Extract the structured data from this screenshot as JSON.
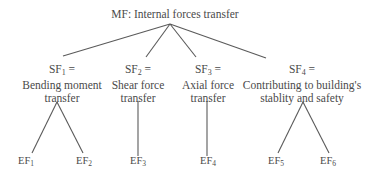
{
  "diagram": {
    "type": "hierarchy-tree",
    "root": {
      "id": "MF",
      "label": "MF: Internal forces transfer"
    },
    "sub_functions": [
      {
        "id": "SF",
        "index": "1",
        "prefix": "SF",
        "equals": " =",
        "lines": [
          "Bending moment",
          "transfer"
        ],
        "children": [
          "EF1",
          "EF2"
        ]
      },
      {
        "id": "SF",
        "index": "2",
        "prefix": "SF",
        "equals": " =",
        "lines": [
          "Shear force",
          "transfer"
        ],
        "children": [
          "EF3"
        ]
      },
      {
        "id": "SF",
        "index": "3",
        "prefix": "SF",
        "equals": " =",
        "lines": [
          "Axial force",
          "transfer"
        ],
        "children": [
          "EF4"
        ]
      },
      {
        "id": "SF",
        "index": "4",
        "prefix": "SF",
        "equals": " =",
        "lines": [
          "Contributing to building's",
          "stablity and safety"
        ],
        "children": [
          "EF5",
          "EF6"
        ]
      }
    ],
    "elementary_functions": [
      {
        "prefix": "EF",
        "index": "1"
      },
      {
        "prefix": "EF",
        "index": "2"
      },
      {
        "prefix": "EF",
        "index": "3"
      },
      {
        "prefix": "EF",
        "index": "4"
      },
      {
        "prefix": "EF",
        "index": "5"
      },
      {
        "prefix": "EF",
        "index": "6"
      }
    ],
    "colors": {
      "line": "#5a5a5a",
      "text": "#4a4a4a",
      "background": "#ffffff"
    }
  }
}
